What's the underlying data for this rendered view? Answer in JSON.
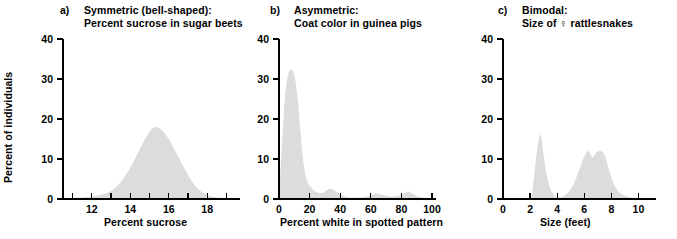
{
  "figure": {
    "shared_ylabel": "Percent of individuals",
    "fill_color": "#dcdcdc",
    "axis_color": "#000000"
  },
  "panels": [
    {
      "letter": "a)",
      "title_line1": "Symmetric (bell-shaped):",
      "title_line2": "Percent sucrose in sugar beets",
      "ylabel": "Percent of individuals",
      "xlabel": "Percent sucrose"
    },
    {
      "letter": "b)",
      "title_line1": "Asymmetric:",
      "title_line2": "Coat color in guinea pigs",
      "ylabel": "",
      "xlabel": "Percent white in spotted pattern"
    },
    {
      "letter": "c)",
      "title_line1": "Bimodal:",
      "title_line2": "Size of ♀ rattlesnakes",
      "ylabel": "",
      "xlabel": "Size (feet)"
    }
  ],
  "chart_data": [
    {
      "type": "area",
      "panel": "a",
      "title": "Symmetric (bell-shaped): Percent sucrose in sugar beets",
      "xlabel": "Percent sucrose",
      "ylabel": "Percent of individuals",
      "xlim": [
        10.5,
        19.5
      ],
      "ylim": [
        0,
        40
      ],
      "yticks": [
        0,
        10,
        20,
        30,
        40
      ],
      "ytick_labels": [
        "0",
        "10",
        "20",
        "30",
        "40"
      ],
      "xticks": [
        11,
        12,
        13,
        14,
        15,
        16,
        17,
        18,
        19
      ],
      "xtick_labels": [
        "",
        "12",
        "",
        "14",
        "",
        "16",
        "",
        "18",
        ""
      ],
      "grid": false,
      "legend": "none",
      "x": [
        10.5,
        11.0,
        11.5,
        12.0,
        12.5,
        13.0,
        13.5,
        14.0,
        14.5,
        15.0,
        15.3,
        15.6,
        16.0,
        16.5,
        17.0,
        17.5,
        18.0,
        18.5,
        19.0,
        19.5
      ],
      "values": [
        0.2,
        0.3,
        0.4,
        0.6,
        1.1,
        2.0,
        4.2,
        7.8,
        12.5,
        16.8,
        18.0,
        17.4,
        15.0,
        10.5,
        6.0,
        2.6,
        1.0,
        0.4,
        0.2,
        0.1
      ]
    },
    {
      "type": "area",
      "panel": "b",
      "title": "Asymmetric: Coat color in guinea pigs",
      "xlabel": "Percent white in spotted pattern",
      "ylabel": "Percent of individuals",
      "xlim": [
        0,
        100
      ],
      "ylim": [
        0,
        40
      ],
      "yticks": [
        0,
        10,
        20,
        30,
        40
      ],
      "ytick_labels": [
        "0",
        "10",
        "20",
        "30",
        "40"
      ],
      "xticks": [
        0,
        20,
        40,
        60,
        80,
        100
      ],
      "xtick_labels": [
        "0",
        "20",
        "40",
        "60",
        "80",
        "100"
      ],
      "grid": false,
      "legend": "none",
      "x": [
        0,
        2,
        4,
        6,
        8,
        10,
        12,
        14,
        16,
        18,
        20,
        24,
        28,
        32,
        34,
        36,
        40,
        44,
        50,
        56,
        60,
        64,
        68,
        74,
        80,
        84,
        88,
        92,
        96,
        100
      ],
      "values": [
        0.0,
        14.0,
        26.0,
        31.0,
        32.3,
        31.0,
        26.0,
        17.0,
        9.0,
        5.0,
        3.4,
        1.8,
        1.5,
        2.4,
        2.6,
        2.2,
        1.3,
        0.5,
        0.4,
        0.5,
        1.0,
        1.3,
        1.0,
        0.6,
        1.0,
        1.9,
        1.2,
        0.5,
        0.3,
        0.1
      ]
    },
    {
      "type": "area",
      "panel": "c",
      "title": "Bimodal: Size of ♀ rattlesnakes",
      "xlabel": "Size (feet)",
      "ylabel": "Percent of individuals",
      "xlim": [
        0,
        11
      ],
      "ylim": [
        0,
        40
      ],
      "yticks": [
        0,
        10,
        20,
        30,
        40
      ],
      "ytick_labels": [
        "0",
        "10",
        "20",
        "30",
        "40"
      ],
      "xticks": [
        0,
        2,
        4,
        6,
        8,
        10
      ],
      "xtick_labels": [
        "0",
        "2",
        "4",
        "6",
        "8",
        "10"
      ],
      "grid": false,
      "legend": "none",
      "x": [
        0,
        1.0,
        2.0,
        2.2,
        2.4,
        2.6,
        2.8,
        3.0,
        3.2,
        3.5,
        3.8,
        4.0,
        4.4,
        4.8,
        5.2,
        5.6,
        6.0,
        6.3,
        6.6,
        6.9,
        7.2,
        7.5,
        7.8,
        8.0,
        8.3,
        8.6,
        9.0,
        9.4,
        10.0,
        11.0
      ],
      "values": [
        0.0,
        0.0,
        0.2,
        3.0,
        9.0,
        14.0,
        16.0,
        11.0,
        6.5,
        2.5,
        0.8,
        0.4,
        0.6,
        1.6,
        3.6,
        7.0,
        10.6,
        12.0,
        10.4,
        11.6,
        12.0,
        11.0,
        7.6,
        5.4,
        3.0,
        1.6,
        0.8,
        0.4,
        0.2,
        0.0
      ]
    }
  ]
}
